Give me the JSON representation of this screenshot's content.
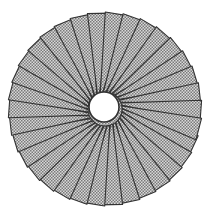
{
  "figure": {
    "center": [
      105,
      109
    ],
    "outer_radius": 97,
    "hole_radius": 15,
    "hole_center": [
      104,
      107
    ],
    "flap_count": 34,
    "colors": {
      "fill_light": "#d9d9d9",
      "fill_dark": "#7a7a7a",
      "line": "#333333",
      "background": "#ffffff"
    }
  }
}
